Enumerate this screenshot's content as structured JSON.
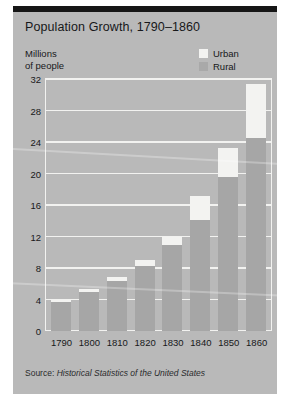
{
  "card": {
    "title": "Population Growth, 1790–1860",
    "source": "Source: Historical Statistics of the United States",
    "source_prefix": "Source: ",
    "source_italic": "Historical Statistics of the United States"
  },
  "axis": {
    "y_caption_line1": "Millions",
    "y_caption_line2": "of people"
  },
  "legend": {
    "urban_label": "Urban",
    "rural_label": "Rural",
    "urban_color": "#f3f3f1",
    "rural_color": "#a6a6a6"
  },
  "colors": {
    "card_background": "#b9b9b9",
    "page_background": "#ffffff",
    "top_rule": "#161616",
    "gridline": "#f2f2f0",
    "text": "#17181a"
  },
  "chart_data": {
    "type": "bar",
    "title": "Population Growth, 1790–1860",
    "xlabel": "",
    "ylabel": "Millions of people",
    "categories": [
      "1790",
      "1800",
      "1810",
      "1820",
      "1830",
      "1840",
      "1850",
      "1860"
    ],
    "series": [
      {
        "name": "Rural",
        "values": [
          3.7,
          5.0,
          6.4,
          8.3,
          10.9,
          14.1,
          19.6,
          24.5
        ]
      },
      {
        "name": "Urban",
        "values": [
          0.2,
          0.3,
          0.5,
          0.7,
          1.1,
          3.0,
          3.6,
          6.9
        ]
      }
    ],
    "totals": [
      3.9,
      5.3,
      6.9,
      9.0,
      12.0,
      17.1,
      23.2,
      31.4
    ],
    "stacked": true,
    "ylim": [
      0,
      32
    ],
    "yticks": [
      "0",
      "4",
      "8",
      "12",
      "16",
      "20",
      "24",
      "28",
      "32"
    ],
    "ytick_values": [
      0,
      4,
      8,
      12,
      16,
      20,
      24,
      28,
      32
    ],
    "grid": true,
    "legend_position": "top-right"
  }
}
